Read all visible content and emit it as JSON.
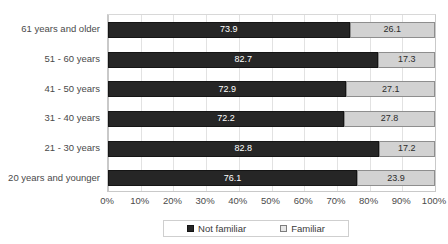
{
  "chart_data": {
    "type": "bar",
    "orientation": "horizontal",
    "stacked": true,
    "stacked_percent": true,
    "title": "",
    "xlabel": "",
    "ylabel": "",
    "xlim": [
      0,
      100
    ],
    "xticks": [
      "0%",
      "10%",
      "20%",
      "30%",
      "40%",
      "50%",
      "60%",
      "70%",
      "80%",
      "90%",
      "100%"
    ],
    "grid": true,
    "legend_position": "bottom",
    "categories": [
      "61 years and older",
      "51 - 60 years",
      "41 - 50 years",
      "31 - 40 years",
      "21 - 30 years",
      "20 years and younger"
    ],
    "series": [
      {
        "name": "Not familiar",
        "color": "#262626",
        "values": [
          73.9,
          82.7,
          72.9,
          72.2,
          82.8,
          76.1
        ],
        "labels": [
          "73.9",
          "82.7",
          "72.9",
          "72.2",
          "82.8",
          "76.1"
        ]
      },
      {
        "name": "Familiar",
        "color": "#d2d2d2",
        "values": [
          26.1,
          17.3,
          27.1,
          27.8,
          17.2,
          23.9
        ],
        "labels": [
          "26.1",
          "17.3",
          "27.1",
          "27.8",
          "17.2",
          "23.9"
        ]
      }
    ]
  },
  "legend": {
    "items": [
      {
        "label": "Not familiar",
        "swatch": "dark-square-icon"
      },
      {
        "label": "Familiar",
        "swatch": "light-square-icon"
      }
    ]
  }
}
